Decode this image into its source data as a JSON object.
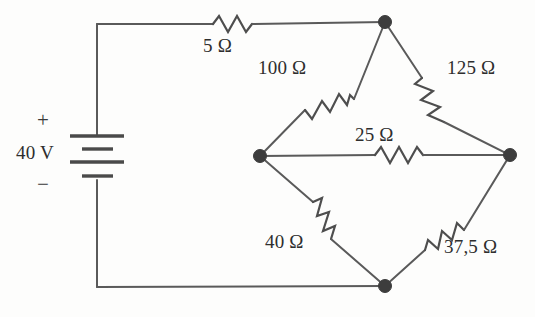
{
  "figure": {
    "type": "circuit-schematic",
    "background_color": "#fdfdfc",
    "line_color": "#5a5a5a",
    "text_color": "#2e2e2e"
  },
  "source": {
    "name": "dc-voltage-source",
    "symbol": "battery",
    "value_label": "40 V",
    "polarity_plus": "+",
    "polarity_minus": "−",
    "plus_terminal": "top",
    "minus_terminal": "bottom"
  },
  "components": [
    {
      "id": "R1",
      "name": "resistor-5-ohm",
      "label": "5 Ω",
      "value": 5,
      "unit": "Ω",
      "orientation": "horizontal",
      "branch": "source-plus to top-node"
    },
    {
      "id": "R2",
      "name": "resistor-100-ohm",
      "label": "100 Ω",
      "value": 100,
      "unit": "Ω",
      "orientation": "diagonal",
      "branch": "left-node to top-node"
    },
    {
      "id": "R3",
      "name": "resistor-125-ohm",
      "label": "125 Ω",
      "value": 125,
      "unit": "Ω",
      "orientation": "diagonal",
      "branch": "top-node to right-node"
    },
    {
      "id": "R4",
      "name": "resistor-25-ohm",
      "label": "25 Ω",
      "value": 25,
      "unit": "Ω",
      "orientation": "horizontal",
      "branch": "left-node to right-node"
    },
    {
      "id": "R5",
      "name": "resistor-40-ohm",
      "label": "40 Ω",
      "value": 40,
      "unit": "Ω",
      "orientation": "diagonal",
      "branch": "left-node to bottom-node"
    },
    {
      "id": "R6",
      "name": "resistor-37-5-ohm",
      "label": "37,5 Ω",
      "value": 37.5,
      "unit": "Ω",
      "orientation": "diagonal",
      "branch": "bottom-node to right-node"
    }
  ],
  "nodes": [
    {
      "name": "top-node",
      "x": 385,
      "y": 22
    },
    {
      "name": "left-node",
      "x": 260,
      "y": 156
    },
    {
      "name": "right-node",
      "x": 510,
      "y": 155
    },
    {
      "name": "bottom-node",
      "x": 385,
      "y": 286
    }
  ]
}
